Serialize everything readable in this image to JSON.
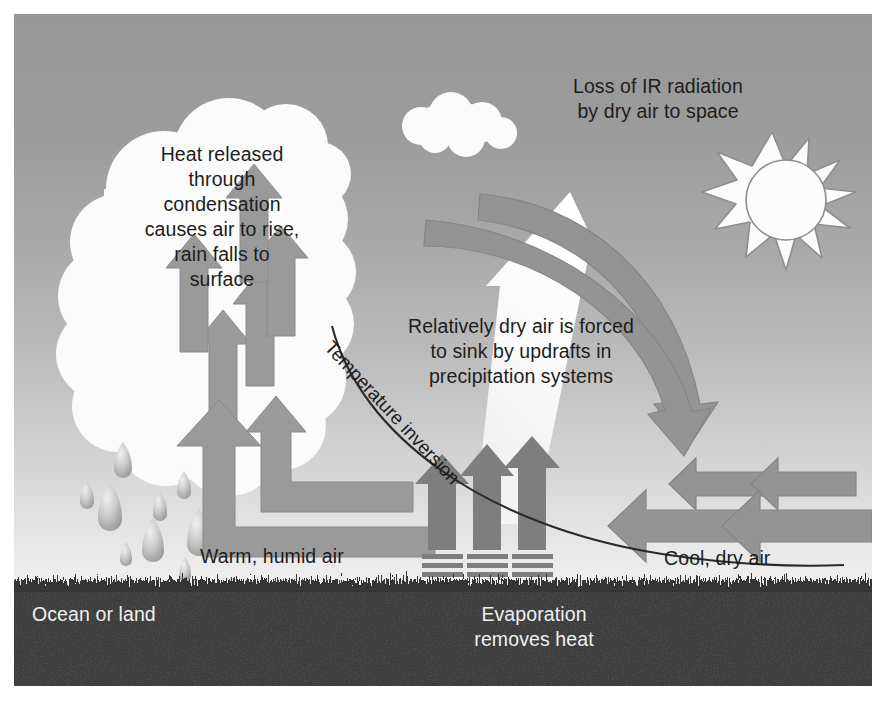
{
  "figure": {
    "background_top_color": "#979797",
    "background_bottom_color": "#f4f4f4",
    "ground_color": "#333333",
    "arrow_color": "#949494",
    "arrow_dark_color": "#7b7b7b",
    "cloud_color": "#fbfbfb",
    "text_color": "#1d1d1d",
    "text_color_inverse": "#f0f0f0"
  },
  "labels": {
    "heat_released": "Heat released\nthrough\ncondensation\ncauses air to rise,\nrain falls to\nsurface",
    "ir_loss": "Loss of IR radiation\nby dry air to space",
    "dry_air_sinks": "Relatively dry air is forced\nto sink by updrafts in\nprecipitation systems",
    "temperature_inversion": "Temperature inversion",
    "warm_humid_air": "Warm, humid air",
    "cool_dry_air": "Cool, dry air",
    "ocean_or_land": "Ocean or land",
    "evaporation": "Evaporation\nremoves heat"
  },
  "elements": {
    "sun": "sun-icon",
    "small_cloud": "cloud-icon",
    "large_cloud": "cumulus-cloud-icon",
    "raindrops": "raindrop-icon",
    "updraft_arrows": "up-arrow-icon",
    "elbow_inflow_arrows": "elbow-arrow-icon",
    "descending_arrows": "curved-down-arrow-icon",
    "return_flow_arrows": "left-arrow-icon",
    "evaporation_arrows": "evaporation-arrow-icon",
    "ir_beam": "ir-beam-arrow-icon",
    "inversion_curve": "inversion-curve-line"
  }
}
